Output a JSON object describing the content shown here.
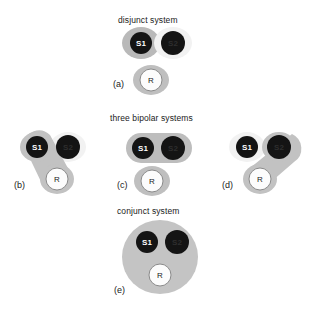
{
  "figure": {
    "headings": [
      {
        "id": "disjunct",
        "text": "disjunct system",
        "x": 118,
        "y": 15
      },
      {
        "id": "three-bipolar",
        "text": "three bipolar systems",
        "x": 110,
        "y": 113
      },
      {
        "id": "conjunct",
        "text": "conjunct system",
        "x": 117,
        "y": 206
      }
    ],
    "node_labels": {
      "s1": "S1",
      "s2": "S2",
      "r": "R"
    },
    "colors": {
      "node_dark_fill": "#141414",
      "node_dark_text": "#ffffff",
      "node_s2_text": "#2e2e2e",
      "node_r_fill": "#fcfcfc",
      "node_r_stroke": "#8a8a8a",
      "node_r_text": "#1a1a1a",
      "blob_gray": "#b9b9b9",
      "blob_light": "#efefef",
      "halo_white": "#fbfbfb",
      "background": "#ffffff",
      "text": "#1a1a1a"
    },
    "panels": [
      {
        "id": "a",
        "label": "(a)",
        "label_x": 113,
        "label_y": 79,
        "caption_group": "disjunct",
        "description": "S1 and S2 each in separate blobs; R in its own blob below",
        "nodes": [
          {
            "name": "S1",
            "style": "dark",
            "blob": "gray"
          },
          {
            "name": "S2",
            "style": "dark",
            "blob": "light"
          },
          {
            "name": "R",
            "style": "outline",
            "blob": "gray"
          }
        ]
      },
      {
        "id": "b",
        "label": "(b)",
        "label_x": 14,
        "label_y": 180,
        "caption_group": "three-bipolar",
        "description": "S1 linked to R by a diagonal gray capsule; S2 isolated in light blob",
        "linked": [
          "S1",
          "R"
        ]
      },
      {
        "id": "c",
        "label": "(c)",
        "label_x": 117,
        "label_y": 180,
        "caption_group": "three-bipolar",
        "description": "S1 and S2 share one gray capsule; R separate below",
        "linked": [
          "S1",
          "S2"
        ]
      },
      {
        "id": "d",
        "label": "(d)",
        "label_x": 222,
        "label_y": 180,
        "caption_group": "three-bipolar",
        "description": "S2 linked to R by a diagonal gray capsule; S1 isolated in light blob",
        "linked": [
          "S2",
          "R"
        ]
      },
      {
        "id": "e",
        "label": "(e)",
        "label_x": 114,
        "label_y": 285,
        "caption_group": "conjunct",
        "description": "S1, S2 and R all enclosed in one large gray blob",
        "linked": [
          "S1",
          "S2",
          "R"
        ]
      }
    ]
  }
}
